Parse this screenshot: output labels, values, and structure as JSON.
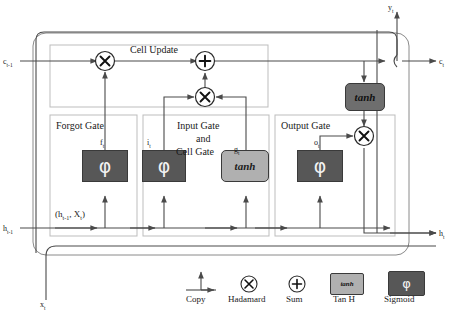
{
  "diagram": {
    "colors": {
      "sigmoid_fill": "#575757",
      "tanh_fill": "#b0b0b0",
      "tanh_top_fill": "#6e6e6e",
      "line": "#4a4a4a",
      "inner_border": "#bdbdbd",
      "outer_border": "#8a8a8a",
      "text": "#1a1a1a"
    }
  },
  "io_labels": {
    "cell_in": "c",
    "cell_in_sub": "t-1",
    "hidden_in": "h",
    "hidden_in_sub": "t-1",
    "input_x": "x",
    "input_x_sub": "t",
    "cell_out": "c",
    "cell_out_sub": "t",
    "hidden_out": "h",
    "hidden_out_sub": "t",
    "output_y": "y",
    "output_y_sub": "t"
  },
  "sections": {
    "cell_update": "Cell Update",
    "forget_gate": "Forgot Gate",
    "input_gate_line1": "Input Gate",
    "input_gate_line2": "and",
    "input_gate_line3": "Cell Gate",
    "output_gate": "Output Gate"
  },
  "concat_label": {
    "open": "(h",
    "sub1": "t-1",
    "mid": ", X",
    "sub2": "t",
    "close": ")"
  },
  "gate_vars": {
    "forget": "f",
    "forget_sub": "t",
    "input": "i",
    "input_sub": "t",
    "cell_candidate": "g",
    "cell_candidate_sub": "t",
    "output": "o",
    "output_sub": "t"
  },
  "blocks": [
    {
      "name": "forget-sigmoid",
      "glyph": "φ",
      "kind": "sigmoid"
    },
    {
      "name": "input-sigmoid",
      "glyph": "φ",
      "kind": "sigmoid"
    },
    {
      "name": "cell-tanh",
      "glyph": "tanh",
      "kind": "tanh"
    },
    {
      "name": "output-sigmoid",
      "glyph": "φ",
      "kind": "sigmoid"
    },
    {
      "name": "top-tanh",
      "glyph": "tanh",
      "kind": "tanh-dark"
    }
  ],
  "operators": [
    {
      "name": "forget-hadamard",
      "symbol": "×"
    },
    {
      "name": "cell-sum",
      "symbol": "+"
    },
    {
      "name": "input-hadamard",
      "symbol": "×"
    },
    {
      "name": "output-hadamard",
      "symbol": "×"
    }
  ],
  "legend": {
    "items": [
      {
        "name": "copy",
        "label": "Copy",
        "icon": "copy-branch-icon"
      },
      {
        "name": "hadamard",
        "label": "Hadamard",
        "icon": "circle-times-icon",
        "symbol": "×"
      },
      {
        "name": "sum",
        "label": "Sum",
        "icon": "circle-plus-icon",
        "symbol": "+"
      },
      {
        "name": "tanh",
        "label": "Tan H",
        "icon": "tanh-swatch-icon",
        "symbol": "tanh"
      },
      {
        "name": "sigmoid",
        "label": "Sigmoid",
        "icon": "sigmoid-swatch-icon",
        "symbol": "φ"
      }
    ]
  }
}
